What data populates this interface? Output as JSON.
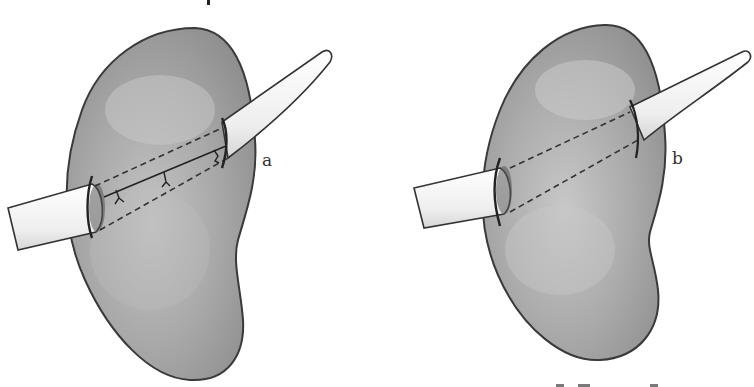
{
  "figure": {
    "panels": [
      {
        "id": "a",
        "label": "a",
        "description": "Kidney with drainage tube passed through parenchyma; tract closed with interrupted sutures along the tube"
      },
      {
        "id": "b",
        "label": "b",
        "description": "Kidney with drainage tube passed through parenchyma; dashed lines indicate tube course through tissue"
      }
    ],
    "colors": {
      "background": "#ffffff",
      "organ_fill": "#a9a9a9",
      "organ_outline": "#3a3a3a",
      "tube_fill": "#efefef",
      "ink": "#222222"
    }
  }
}
